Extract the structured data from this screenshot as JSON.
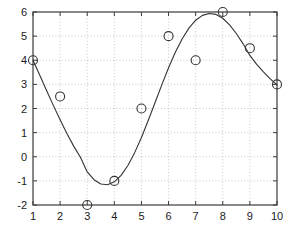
{
  "chart_data": {
    "type": "scatter",
    "title": "",
    "xlabel": "",
    "ylabel": "",
    "xlim": [
      1,
      10
    ],
    "ylim": [
      -2,
      6
    ],
    "grid": true,
    "legend": null,
    "legend_position": "none",
    "x_ticks": [
      1,
      2,
      3,
      4,
      5,
      6,
      7,
      8,
      9,
      10
    ],
    "x_tick_labels": [
      "1",
      "2",
      "3",
      "4",
      "5",
      "6",
      "7",
      "8",
      "9",
      "10"
    ],
    "y_ticks": [
      -2,
      -1,
      0,
      1,
      2,
      3,
      4,
      5,
      6
    ],
    "y_tick_labels": [
      "-2",
      "-1",
      "0",
      "1",
      "2",
      "3",
      "4",
      "5",
      "6"
    ],
    "series": [
      {
        "name": "data-points",
        "type": "scatter",
        "marker": "open-circle",
        "marker_size": 9,
        "color": "#333333",
        "x": [
          1,
          2,
          3,
          4,
          5,
          6,
          7,
          8,
          9,
          10
        ],
        "values": [
          4,
          2.5,
          -2,
          -1,
          2,
          5,
          4,
          6,
          4.5,
          3
        ]
      },
      {
        "name": "fitted-curve",
        "type": "line",
        "color": "#333333",
        "line_width": 1.1,
        "x": [
          1,
          1.25,
          1.5,
          1.75,
          2,
          2.25,
          2.5,
          2.75,
          3,
          3.25,
          3.5,
          3.75,
          4,
          4.25,
          4.5,
          4.75,
          5,
          5.25,
          5.5,
          5.75,
          6,
          6.25,
          6.5,
          6.75,
          7,
          7.25,
          7.5,
          7.75,
          8,
          8.25,
          8.5,
          8.75,
          9,
          9.25,
          9.5,
          9.75,
          10
        ],
        "values": [
          4.0,
          3.38,
          2.75,
          2.13,
          1.53,
          0.96,
          0.44,
          -0.02,
          -0.63,
          -0.95,
          -1.13,
          -1.16,
          -1.04,
          -0.77,
          -0.36,
          0.17,
          0.8,
          1.5,
          2.24,
          2.98,
          3.69,
          4.33,
          4.88,
          5.33,
          5.66,
          5.86,
          5.94,
          5.9,
          5.74,
          5.47,
          5.11,
          4.68,
          4.2,
          3.83,
          3.52,
          3.23,
          2.98
        ]
      }
    ],
    "axis_color": "#3a3a3a",
    "grid_color": "#bbbbbb",
    "background_color": "#ffffff",
    "tick_label_color": "#1a1a1a"
  }
}
